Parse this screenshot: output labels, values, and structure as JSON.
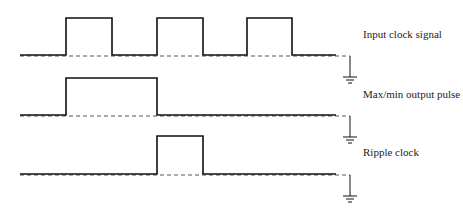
{
  "diagram": {
    "type": "timing-diagram",
    "colors": {
      "line": "#111111",
      "dash": "#555555",
      "background": "#ffffff"
    },
    "signals": [
      {
        "id": "input-clock",
        "label": "Input clock signal",
        "baseline_y": 55,
        "high_y": 18,
        "pulses": [
          [
            66,
            112
          ],
          [
            157,
            203
          ],
          [
            247,
            292
          ]
        ],
        "label_x": 363,
        "label_y": 28,
        "ground_y": 55
      },
      {
        "id": "maxmin-pulse",
        "label": "Max/min output pulse",
        "baseline_y": 115,
        "high_y": 78,
        "pulses": [
          [
            66,
            157
          ]
        ],
        "label_x": 363,
        "label_y": 88,
        "ground_y": 115
      },
      {
        "id": "ripple-clock",
        "label": "Ripple clock",
        "baseline_y": 174,
        "high_y": 136,
        "pulses": [
          [
            157,
            203
          ]
        ],
        "label_x": 363,
        "label_y": 146,
        "ground_y": 174
      }
    ],
    "x_start": 20,
    "solid_end": 336,
    "dash_end": 350
  }
}
